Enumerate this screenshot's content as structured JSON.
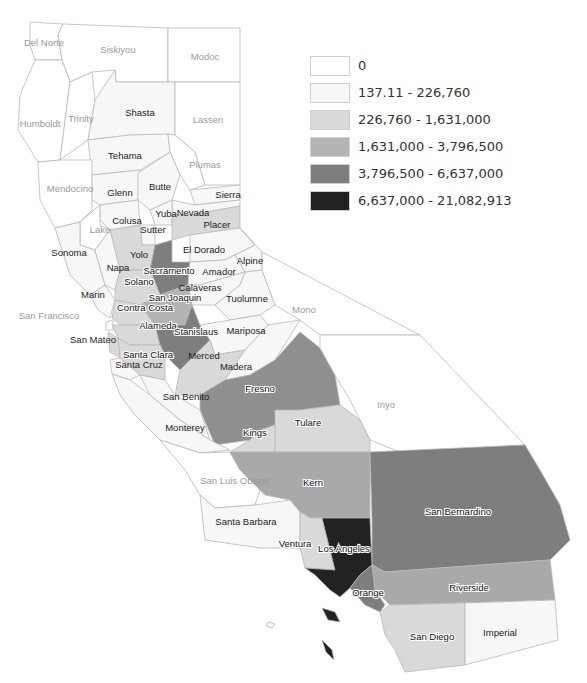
{
  "map": {
    "title": "",
    "region": "California counties",
    "classes": [
      {
        "id": "c0",
        "label": "0",
        "color": "#ffffff"
      },
      {
        "id": "c1",
        "label": "137.11 - 226,760",
        "color": "#f7f7f7"
      },
      {
        "id": "c2",
        "label": "226,760 - 1,631,000",
        "color": "#d9d9d9"
      },
      {
        "id": "c3",
        "label": "1,631,000 - 3,796,500",
        "color": "#b4b4b4"
      },
      {
        "id": "c4",
        "label": "3,796,500 - 6,637,000",
        "color": "#7e7e7e"
      },
      {
        "id": "c5",
        "label": "6,637,000 - 21,082,913",
        "color": "#222222"
      }
    ]
  },
  "legend": {
    "items": [
      {
        "label": "0",
        "color": "#ffffff"
      },
      {
        "label": "137.11 - 226,760",
        "color": "#f7f7f7"
      },
      {
        "label": "226,760 - 1,631,000",
        "color": "#d9d9d9"
      },
      {
        "label": "1,631,000 - 3,796,500",
        "color": "#b4b4b4"
      },
      {
        "label": "3,796,500 - 6,637,000",
        "color": "#7e7e7e"
      },
      {
        "label": "6,637,000 - 21,082,913",
        "color": "#222222"
      }
    ]
  },
  "counties": {
    "del_norte": "Del Norte",
    "siskiyou": "Siskiyou",
    "modoc": "Modoc",
    "humboldt": "Humboldt",
    "trinity": "Trinity",
    "shasta": "Shasta",
    "lassen": "Lassen",
    "tehama": "Tehama",
    "plumas": "Plumas",
    "mendocino": "Mendocino",
    "glenn": "Glenn",
    "butte": "Butte",
    "sierra": "Sierra",
    "nevada": "Nevada",
    "colusa": "Colusa",
    "yuba": "Yuba",
    "lake": "Lake",
    "sutter": "Sutter",
    "placer": "Placer",
    "el_dorado": "El Dorado",
    "sonoma": "Sonoma",
    "yolo": "Yolo",
    "napa": "Napa",
    "alpine": "Alpine",
    "sacramento": "Sacramento",
    "amador": "Amador",
    "solano": "Solano",
    "calaveras": "Calaveras",
    "marin": "Marin",
    "san_joaquin": "San Joaquin",
    "tuolumne": "Tuolumne",
    "contra_costa": "Contra Costa",
    "mono": "Mono",
    "san_francisco": "San Francisco",
    "alameda": "Alameda",
    "stanislaus": "Stanislaus",
    "mariposa": "Mariposa",
    "san_mateo": "San Mateo",
    "santa_clara": "Santa Clara",
    "merced": "Merced",
    "santa_cruz": "Santa Cruz",
    "madera": "Madera",
    "fresno": "Fresno",
    "san_benito": "San Benito",
    "inyo": "Inyo",
    "monterey": "Monterey",
    "tulare": "Tulare",
    "kings": "Kings",
    "san_luis_obispo": "San Luis Obispo",
    "kern": "Kern",
    "santa_barbara": "Santa Barbara",
    "san_bernardino": "San Bernardino",
    "ventura": "Ventura",
    "los_angeles": "Los Angeles",
    "riverside": "Riverside",
    "orange": "Orange",
    "san_diego": "San Diego",
    "imperial": "Imperial"
  }
}
